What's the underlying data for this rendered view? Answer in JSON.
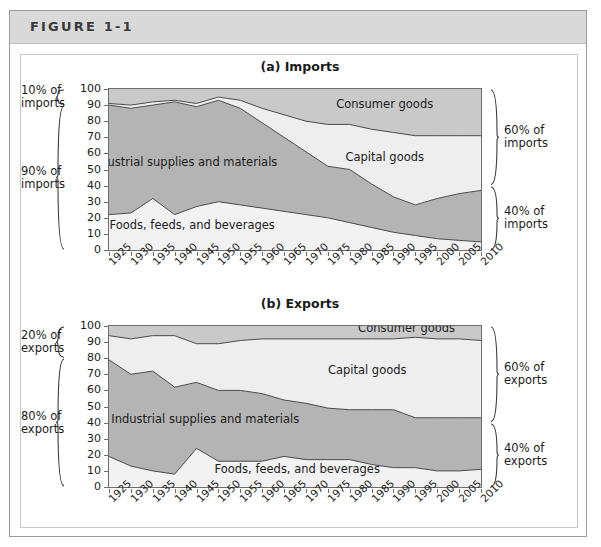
{
  "figure": {
    "label": "FIGURE 1-1"
  },
  "panels": [
    {
      "id": "imports",
      "title": "(a) Imports",
      "left_notes": [
        {
          "text": "10% of\nimports",
          "from": 100,
          "to": 90
        },
        {
          "text": "90% of\nimports",
          "from": 90,
          "to": 0
        }
      ],
      "right_notes": [
        {
          "text": "60% of\nimports",
          "from": 100,
          "to": 40
        },
        {
          "text": "40% of\nimports",
          "from": 40,
          "to": 0
        }
      ]
    },
    {
      "id": "exports",
      "title": "(b) Exports",
      "left_notes": [
        {
          "text": "20% of\nexports",
          "from": 100,
          "to": 80
        },
        {
          "text": "80% of\nexports",
          "from": 80,
          "to": 0
        }
      ],
      "right_notes": [
        {
          "text": "60% of\nexports",
          "from": 100,
          "to": 40
        },
        {
          "text": "40% of\nexports",
          "from": 40,
          "to": 0
        }
      ]
    }
  ],
  "colors": {
    "band_foods": "#f2f2f2",
    "band_industrial": "#b4b4b4",
    "band_capital": "#eeeeee",
    "band_consumer": "#c9c9c9",
    "line": "#4a4a4a",
    "header_bg": "#d9d9d9",
    "frame": "#9a9a9a",
    "text": "#1b1b1b"
  },
  "chart_data": [
    {
      "type": "area",
      "stacked": true,
      "title": "(a) Imports",
      "xlabel": "",
      "ylabel": "",
      "xlim": [
        1925,
        2010
      ],
      "ylim": [
        0,
        100
      ],
      "grid": false,
      "legend": "inline-annotations",
      "x": [
        1925,
        1930,
        1935,
        1940,
        1945,
        1950,
        1955,
        1960,
        1965,
        1970,
        1975,
        1980,
        1985,
        1990,
        1995,
        2000,
        2005,
        2010
      ],
      "yticks": [
        0,
        10,
        20,
        30,
        40,
        50,
        60,
        70,
        80,
        90,
        100
      ],
      "xticks": [
        1925,
        1930,
        1935,
        1940,
        1945,
        1950,
        1955,
        1960,
        1965,
        1970,
        1975,
        1980,
        1985,
        1990,
        1995,
        2000,
        2005,
        2010
      ],
      "series": [
        {
          "name": "Foods, feeds, and beverages",
          "values": [
            22,
            23,
            32,
            22,
            27,
            30,
            28,
            26,
            24,
            22,
            20,
            17,
            14,
            11,
            9,
            7,
            6,
            5
          ]
        },
        {
          "name": "Industrial supplies and materials",
          "values": [
            68,
            65,
            58,
            70,
            62,
            63,
            60,
            53,
            46,
            39,
            32,
            33,
            27,
            22,
            19,
            25,
            29,
            32
          ]
        },
        {
          "name": "Capital goods",
          "values": [
            1,
            2,
            2,
            1,
            2,
            2,
            5,
            9,
            14,
            19,
            26,
            28,
            34,
            40,
            43,
            39,
            36,
            34
          ]
        },
        {
          "name": "Consumer goods",
          "values": [
            9,
            10,
            8,
            7,
            9,
            5,
            7,
            12,
            16,
            20,
            22,
            22,
            25,
            27,
            29,
            29,
            29,
            29
          ]
        }
      ],
      "cumulative_boundaries": {
        "foods_top": [
          22,
          23,
          32,
          22,
          27,
          30,
          28,
          26,
          24,
          22,
          20,
          17,
          14,
          11,
          9,
          7,
          6,
          5
        ],
        "industrial_top": [
          90,
          88,
          90,
          92,
          89,
          93,
          88,
          79,
          70,
          61,
          52,
          50,
          41,
          33,
          28,
          32,
          35,
          37
        ],
        "capital_top": [
          91,
          90,
          92,
          93,
          91,
          95,
          93,
          88,
          84,
          80,
          78,
          78,
          75,
          73,
          71,
          71,
          71,
          71
        ],
        "consumer_top": [
          100,
          100,
          100,
          100,
          100,
          100,
          100,
          100,
          100,
          100,
          100,
          100,
          100,
          100,
          100,
          100,
          100,
          100
        ]
      },
      "annotations": [
        {
          "text": "Industrial supplies and materials",
          "x": 1942,
          "y": 52
        },
        {
          "text": "Foods, feeds, and beverages",
          "x": 1944,
          "y": 13
        },
        {
          "text": "Consumer goods",
          "x": 1988,
          "y": 88
        },
        {
          "text": "Capital goods",
          "x": 1988,
          "y": 55
        }
      ]
    },
    {
      "type": "area",
      "stacked": true,
      "title": "(b) Exports",
      "xlabel": "",
      "ylabel": "",
      "xlim": [
        1925,
        2010
      ],
      "ylim": [
        0,
        100
      ],
      "grid": false,
      "legend": "inline-annotations",
      "x": [
        1925,
        1930,
        1935,
        1940,
        1945,
        1950,
        1955,
        1960,
        1965,
        1970,
        1975,
        1980,
        1985,
        1990,
        1995,
        2000,
        2005,
        2010
      ],
      "yticks": [
        0,
        10,
        20,
        30,
        40,
        50,
        60,
        70,
        80,
        90,
        100
      ],
      "xticks": [
        1925,
        1930,
        1935,
        1940,
        1945,
        1950,
        1955,
        1960,
        1965,
        1970,
        1975,
        1980,
        1985,
        1990,
        1995,
        2000,
        2005,
        2010
      ],
      "series": [
        {
          "name": "Foods, feeds, and beverages",
          "values": [
            19,
            13,
            10,
            8,
            24,
            16,
            16,
            16,
            19,
            17,
            17,
            17,
            14,
            12,
            12,
            10,
            10,
            11
          ]
        },
        {
          "name": "Industrial supplies and materials",
          "values": [
            60,
            57,
            62,
            54,
            41,
            44,
            44,
            42,
            35,
            35,
            32,
            31,
            34,
            36,
            31,
            33,
            33,
            32
          ]
        },
        {
          "name": "Capital goods",
          "values": [
            15,
            22,
            22,
            32,
            24,
            29,
            31,
            34,
            38,
            40,
            43,
            44,
            44,
            44,
            50,
            49,
            49,
            48
          ]
        },
        {
          "name": "Consumer goods",
          "values": [
            6,
            8,
            6,
            6,
            11,
            11,
            9,
            8,
            8,
            8,
            8,
            8,
            8,
            8,
            7,
            8,
            8,
            9
          ]
        }
      ],
      "cumulative_boundaries": {
        "foods_top": [
          19,
          13,
          10,
          8,
          24,
          16,
          16,
          16,
          19,
          17,
          17,
          17,
          14,
          12,
          12,
          10,
          10,
          11
        ],
        "industrial_top": [
          79,
          70,
          72,
          62,
          65,
          60,
          60,
          58,
          54,
          52,
          49,
          48,
          48,
          48,
          43,
          43,
          43,
          43
        ],
        "capital_top": [
          94,
          92,
          94,
          94,
          89,
          89,
          91,
          92,
          92,
          92,
          92,
          92,
          92,
          92,
          93,
          92,
          92,
          91
        ],
        "consumer_top": [
          100,
          100,
          100,
          100,
          100,
          100,
          100,
          100,
          100,
          100,
          100,
          100,
          100,
          100,
          100,
          100,
          100,
          100
        ]
      },
      "annotations": [
        {
          "text": "Industrial supplies and materials",
          "x": 1947,
          "y": 40
        },
        {
          "text": "Foods, feeds, and beverages",
          "x": 1968,
          "y": 9
        },
        {
          "text": "Consumer goods",
          "x": 1993,
          "y": 96
        },
        {
          "text": "Capital goods",
          "x": 1984,
          "y": 70
        }
      ]
    }
  ]
}
